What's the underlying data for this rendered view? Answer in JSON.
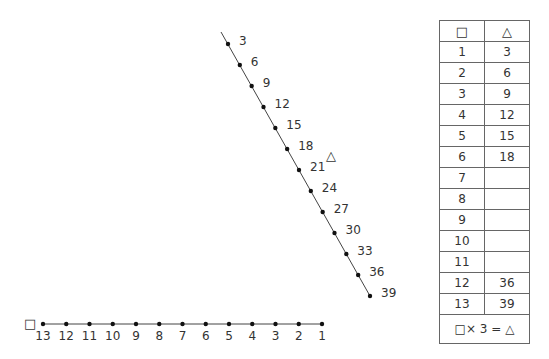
{
  "diagram": {
    "vertical_axis": {
      "symbol": "△",
      "labels": [
        "3",
        "6",
        "9",
        "12",
        "15",
        "18",
        "21",
        "24",
        "27",
        "30",
        "33",
        "36",
        "39"
      ]
    },
    "horizontal_axis": {
      "symbol": "□",
      "labels": [
        "13",
        "12",
        "11",
        "10",
        "9",
        "8",
        "7",
        "6",
        "5",
        "4",
        "3",
        "2",
        "1"
      ]
    }
  },
  "table": {
    "headers": [
      "□",
      "△"
    ],
    "rows": [
      [
        "1",
        "3"
      ],
      [
        "2",
        "6"
      ],
      [
        "3",
        "9"
      ],
      [
        "4",
        "12"
      ],
      [
        "5",
        "15"
      ],
      [
        "6",
        "18"
      ],
      [
        "7",
        ""
      ],
      [
        "8",
        ""
      ],
      [
        "9",
        ""
      ],
      [
        "10",
        ""
      ],
      [
        "11",
        ""
      ],
      [
        "12",
        "36"
      ],
      [
        "13",
        "39"
      ]
    ],
    "formula": "□× 3 = △"
  }
}
